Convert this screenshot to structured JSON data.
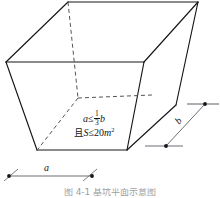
{
  "figure": {
    "kind": "technical-line-drawing",
    "background_color": "#ffffff",
    "line_color": "#16161a",
    "hidden_line_color": "#4a4a52",
    "dimension_line_color": "#6e6e76",
    "caption": "图 4-1 基坑平面示意图"
  },
  "constraints": {
    "line1": {
      "lhs": "a",
      "relation": "≤",
      "fraction_numerator": "1",
      "fraction_denominator": "3",
      "rhs": "b",
      "plain": "a ≤ 1/3 b"
    },
    "line2": {
      "conjunction": "且",
      "lhs": "S",
      "relation": "≤",
      "value": "20",
      "unit": "m",
      "exponent": "2",
      "plain": "且 S ≤ 20 m²"
    }
  },
  "dimensions": [
    {
      "id": "dim-a",
      "label": "a",
      "orientation": "horizontal",
      "position": "bottom",
      "measures": "front bottom width of the solid"
    },
    {
      "id": "dim-b",
      "label": "b",
      "orientation": "diagonal",
      "position": "right",
      "measures": "depth of the solid along the receding edge"
    }
  ],
  "geometry": {
    "top_face": [
      [
        6,
        62
      ],
      [
        68,
        2
      ],
      [
        198,
        2
      ],
      [
        144,
        62
      ]
    ],
    "front_face": [
      [
        6,
        62
      ],
      [
        144,
        62
      ],
      [
        127,
        150
      ],
      [
        37,
        150
      ]
    ],
    "right_face": [
      [
        144,
        62
      ],
      [
        198,
        2
      ],
      [
        176,
        148
      ],
      [
        127,
        150
      ]
    ],
    "hidden_vertex": [
      78,
      98
    ],
    "hidden_edges": [
      [
        [
          68,
          2
        ],
        [
          78,
          98
        ]
      ],
      [
        [
          78,
          98
        ],
        [
          148,
          95
        ]
      ],
      [
        [
          78,
          98
        ],
        [
          38,
          149
        ]
      ]
    ]
  }
}
